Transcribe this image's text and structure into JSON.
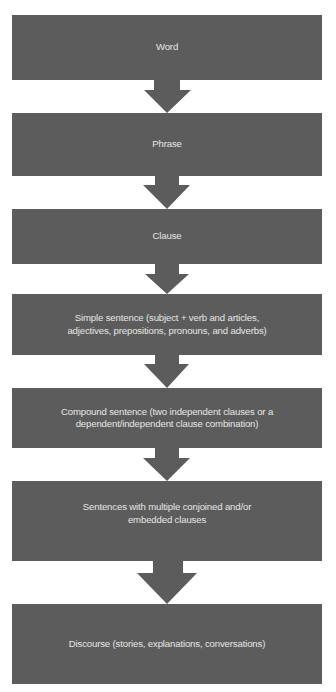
{
  "diagram": {
    "type": "vertical-flowchart",
    "title": "",
    "colors": {
      "box_fill": "#5c5c5c",
      "text": "#e6e6e6",
      "arrow": "#5c5c5c",
      "background": "#ffffff"
    },
    "nodes": [
      {
        "id": "word",
        "label": "Word"
      },
      {
        "id": "phrase",
        "label": "Phrase"
      },
      {
        "id": "clause",
        "label": "Clause"
      },
      {
        "id": "simple",
        "label_lines": [
          "Simple sentence (subject + verb and articles,",
          "adjectives, prepositions, pronouns, and adverbs)"
        ]
      },
      {
        "id": "compound",
        "label_lines": [
          "Compound sentence (two independent clauses or a",
          "dependent/independent clause combination)"
        ]
      },
      {
        "id": "multiple",
        "label_lines": [
          "Sentences with multiple conjoined and/or",
          "embedded clauses"
        ]
      },
      {
        "id": "discourse",
        "label": "Discourse (stories, explanations, conversations)"
      }
    ],
    "edges": [
      {
        "from": "word",
        "to": "phrase"
      },
      {
        "from": "phrase",
        "to": "clause"
      },
      {
        "from": "clause",
        "to": "simple"
      },
      {
        "from": "simple",
        "to": "compound"
      },
      {
        "from": "compound",
        "to": "multiple"
      },
      {
        "from": "multiple",
        "to": "discourse"
      }
    ]
  }
}
